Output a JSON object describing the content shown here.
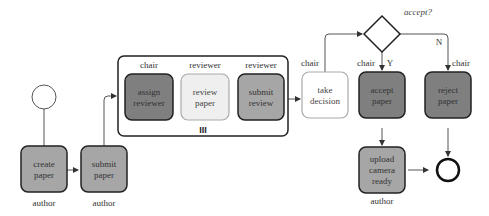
{
  "diagram": {
    "type": "process-flow",
    "nodes": {
      "start": {
        "kind": "start-event"
      },
      "create_paper": {
        "label1": "create",
        "label2": "paper",
        "role": "author",
        "fill": "#a6a6a6"
      },
      "submit_paper": {
        "label1": "submit",
        "label2": "paper",
        "role": "author",
        "fill": "#a6a6a6"
      },
      "assign_reviewer": {
        "label1": "assign",
        "label2": "reviewer",
        "role": "chair",
        "fill": "#7f7f7f"
      },
      "review_paper": {
        "label1": "review",
        "label2": "paper",
        "role": "reviewer",
        "fill": "#efefef"
      },
      "submit_review": {
        "label1": "submit",
        "label2": "review",
        "role": "reviewer",
        "fill": "#a6a6a6"
      },
      "take_decision": {
        "label1": "take",
        "label2": "decision",
        "role": "chair",
        "fill": "#ffffff"
      },
      "gateway": {
        "kind": "exclusive-gateway",
        "label": "accept?"
      },
      "accept_paper": {
        "label1": "accept",
        "label2": "paper",
        "role": "chair",
        "fill": "#7f7f7f"
      },
      "reject_paper": {
        "label1": "reject",
        "label2": "paper",
        "role": "chair",
        "fill": "#7f7f7f"
      },
      "upload_camera_ready": {
        "label1": "upload",
        "label2": "camera",
        "label3": "ready",
        "role": "author",
        "fill": "#a6a6a6"
      },
      "end": {
        "kind": "end-event"
      }
    },
    "subprocess": {
      "marker": "III",
      "kind": "multi-instance"
    },
    "edges": {
      "yes_label": "Y",
      "no_label": "N"
    }
  }
}
